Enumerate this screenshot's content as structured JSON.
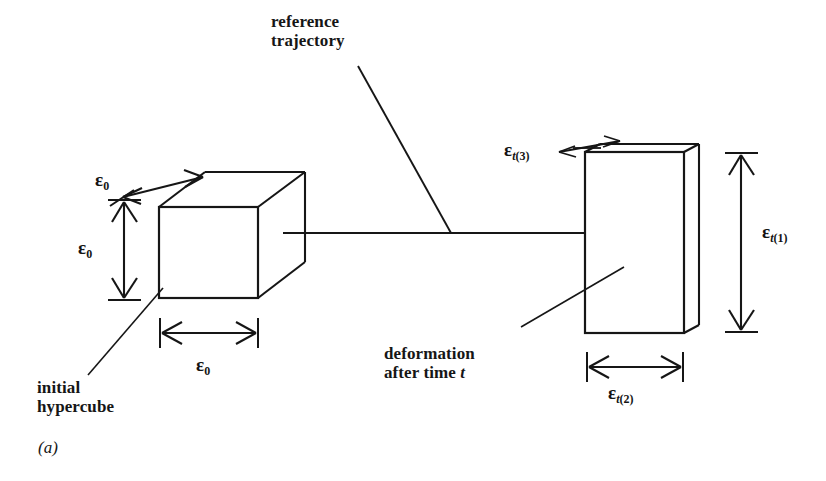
{
  "figure": {
    "caption": "(a)",
    "labels": {
      "reference_trajectory": "reference\ntrajectory",
      "initial_hypercube": "initial\nhypercube",
      "deformation_prefix": "deformation\nafter time ",
      "deformation_time_var": "t"
    },
    "symbols": {
      "epsilon": "ε",
      "initial_depth": "0",
      "initial_height": "0",
      "initial_width": "0",
      "deformed_depth": "t(3)",
      "deformed_height": "t(1)",
      "deformed_width": "t(2)"
    },
    "colors": {
      "ink": "#161616",
      "background": "#ffffff"
    }
  }
}
